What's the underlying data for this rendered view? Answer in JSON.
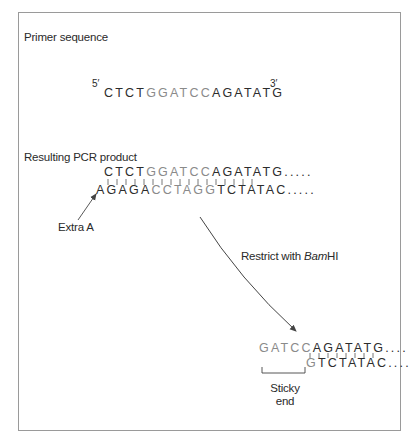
{
  "section_primer": {
    "title": "Primer sequence",
    "five_prime": "5′",
    "three_prime": "3′",
    "sequence_pre": "CTCT",
    "sequence_site": "GGATCC",
    "sequence_post": "AGATATG"
  },
  "section_pcr": {
    "title": "Resulting PCR product",
    "top_pre": "CTCT",
    "top_site": "GGATCC",
    "top_post": "AGATATG.....",
    "bottom_pre": "AGAGA",
    "bottom_site": "CCTAGG",
    "bottom_post": "TCTATAC.....",
    "annotation": "Extra A"
  },
  "restriction": {
    "label_prefix": "Restrict with ",
    "enzyme_italic": "Bam",
    "enzyme_roman": "HI"
  },
  "section_product": {
    "top_overhang": "GATCC",
    "top_rest": "AGATATG....",
    "bottom_start": "G",
    "bottom_rest": "TCTATAC....",
    "bracket_label_line1": "Sticky",
    "bracket_label_line2": "end"
  },
  "colors": {
    "text": "#2a2a2a",
    "highlight": "#8a8a8a",
    "border": "#9a9a9a",
    "line": "#555555"
  }
}
